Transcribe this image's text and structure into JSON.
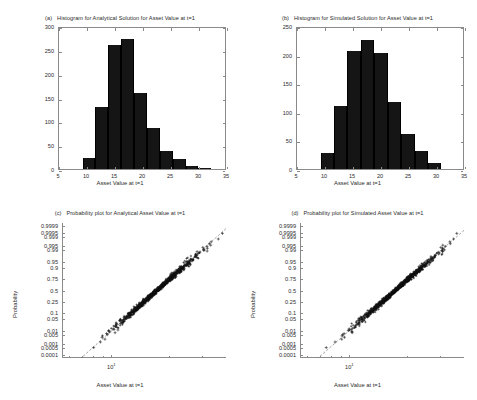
{
  "figure": {
    "background": "#ffffff",
    "axis_color": "#8a8a8a",
    "data_color": "#151515"
  },
  "panels": [
    {
      "tag": "(a)",
      "title": "Histogram for Analytical Solution for Asset Value at t=1",
      "xlabel": "Asset Value at t=1",
      "ylabel": ""
    },
    {
      "tag": "(b)",
      "title": "Histogram for Simulated Solution for Asset Value at t=1",
      "xlabel": "Asset Value at t=1",
      "ylabel": ""
    },
    {
      "tag": "(c)",
      "title": "Probability plot for Analytical Asset Value at t=1",
      "xlabel": "Asset Value at t=1",
      "ylabel": "Probability"
    },
    {
      "tag": "(d)",
      "title": "Probability plot for Simulated Asset Value at t=1",
      "xlabel": "Asset Value at t=1",
      "ylabel": "Probability"
    }
  ],
  "chart_data": [
    {
      "type": "bar",
      "panel": "(a)",
      "title": "Histogram for Analytical Solution for Asset Value at t=1",
      "xlabel": "Asset Value at t=1",
      "ylabel": "",
      "xlim": [
        5,
        35
      ],
      "ylim": [
        0,
        300
      ],
      "xticks": [
        5,
        10,
        15,
        20,
        25,
        30,
        35
      ],
      "yticks": [
        0,
        50,
        100,
        150,
        200,
        250,
        300
      ],
      "grid": false,
      "bin_edges": [
        9.2,
        11.5,
        13.8,
        16.1,
        18.4,
        20.7,
        23.0,
        25.3,
        27.6,
        29.9,
        32.2
      ],
      "categories": [
        "9.2-11.5",
        "11.5-13.8",
        "13.8-16.1",
        "16.1-18.4",
        "18.4-20.7",
        "20.7-23.0",
        "23.0-25.3",
        "25.3-27.6",
        "27.6-29.9",
        "29.9-32.2"
      ],
      "values": [
        24,
        131,
        260,
        272,
        159,
        86,
        37,
        20,
        6,
        2
      ]
    },
    {
      "type": "bar",
      "panel": "(b)",
      "title": "Histogram for Simulated Solution for Asset Value at t=1",
      "xlabel": "Asset Value at t=1",
      "ylabel": "",
      "xlim": [
        5,
        35
      ],
      "ylim": [
        0,
        250
      ],
      "xticks": [
        5,
        10,
        15,
        20,
        25,
        30,
        35
      ],
      "yticks": [
        0,
        50,
        100,
        150,
        200,
        250
      ],
      "grid": false,
      "bin_edges": [
        9.2,
        11.6,
        14.0,
        16.4,
        18.8,
        21.2,
        23.6,
        26.0,
        28.4,
        30.8
      ],
      "categories": [
        "9.2-11.6",
        "11.6-14.0",
        "14.0-16.4",
        "16.4-18.8",
        "18.8-21.2",
        "21.2-23.6",
        "23.6-26.0",
        "26.0-28.4",
        "28.4-30.8"
      ],
      "values": [
        28,
        110,
        207,
        226,
        203,
        118,
        61,
        31,
        11
      ]
    },
    {
      "type": "scatter",
      "panel": "(c)",
      "title": "Probability plot for Analytical Asset Value at t=1",
      "xlabel": "Asset Value at t=1",
      "ylabel": "Probability",
      "xscale": "log",
      "xlim": [
        5.5,
        40
      ],
      "xticks": [
        10
      ],
      "xtick_labels": [
        "10¹"
      ],
      "yscale": "normal-probability",
      "yticks": [
        0.0001,
        0.0005,
        0.001,
        0.005,
        0.01,
        0.05,
        0.1,
        0.25,
        0.5,
        0.75,
        0.9,
        0.95,
        0.99,
        0.995,
        0.999,
        0.9995,
        0.9999
      ],
      "ytick_labels": [
        "0.0001",
        "0.0005",
        "0.001",
        "0.005",
        "0.01",
        "0.05",
        "0.1",
        "0.25",
        "0.5",
        "0.75",
        "0.9",
        "0.95",
        "0.99",
        "0.995",
        "0.999",
        "0.9995",
        "0.9999"
      ],
      "grid": false,
      "marker": "+",
      "reference_line": "dashed",
      "n_points": 1000,
      "distribution": "lognormal",
      "median": 17.3,
      "sigma_log": 0.235,
      "comment": "Dense band of '+' markers following the dashed lognormal reference line from about 7 at p=0.001 to about 33 at p=0.999"
    },
    {
      "type": "scatter",
      "panel": "(d)",
      "title": "Probability plot for Simulated Asset Value at t=1",
      "xlabel": "Asset Value at t=1",
      "ylabel": "Probability",
      "xscale": "log",
      "xlim": [
        5.5,
        40
      ],
      "xticks": [
        10
      ],
      "xtick_labels": [
        "10¹"
      ],
      "yscale": "normal-probability",
      "yticks": [
        0.0001,
        0.0005,
        0.001,
        0.005,
        0.01,
        0.05,
        0.1,
        0.25,
        0.5,
        0.75,
        0.9,
        0.95,
        0.99,
        0.995,
        0.999,
        0.9995,
        0.9999
      ],
      "ytick_labels": [
        "0.0001",
        "0.0005",
        "0.001",
        "0.005",
        "0.01",
        "0.05",
        "0.1",
        "0.25",
        "0.5",
        "0.75",
        "0.9",
        "0.95",
        "0.99",
        "0.995",
        "0.999",
        "0.9995",
        "0.9999"
      ],
      "grid": false,
      "marker": "+",
      "reference_line": "dashed",
      "n_points": 1000,
      "distribution": "lognormal",
      "median": 17.4,
      "sigma_log": 0.24,
      "comment": "Dense band of '+' markers following the dashed lognormal reference line from about 7 at p=0.001 to about 34 at p=0.999"
    }
  ]
}
